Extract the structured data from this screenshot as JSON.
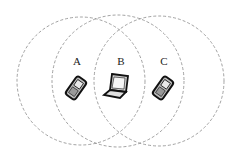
{
  "diagram": {
    "nodes": [
      {
        "id": "A",
        "label": "A",
        "device": "mobile-phone",
        "x": 77,
        "y": 61
      },
      {
        "id": "B",
        "label": "B",
        "device": "laptop",
        "x": 121,
        "y": 61
      },
      {
        "id": "C",
        "label": "C",
        "device": "mobile-phone",
        "x": 164,
        "y": 61
      }
    ],
    "ranges": [
      {
        "id": "range-A",
        "cx": 81,
        "cy": 81,
        "r": 64
      },
      {
        "id": "range-B",
        "cx": 118,
        "cy": 81,
        "r": 66
      },
      {
        "id": "range-C",
        "cx": 159,
        "cy": 81,
        "r": 65
      }
    ],
    "colors": {
      "circle": "#888888",
      "device": "#1a1a1a",
      "device_fill": "#bbbbbb"
    }
  }
}
